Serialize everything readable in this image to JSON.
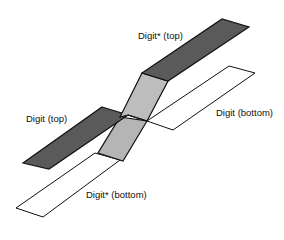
{
  "diagram": {
    "labels": {
      "digit_star_top": "Digit* (top)",
      "digit_top": "Digit (top)",
      "digit_bottom": "Digit (bottom)",
      "digit_star_bottom": "Digit* (bottom)"
    },
    "colors": {
      "dark_strip": "#5a5a5a",
      "light_strip": "#b8b8b8",
      "white_strip": "#ffffff",
      "outline": "#111111"
    }
  }
}
